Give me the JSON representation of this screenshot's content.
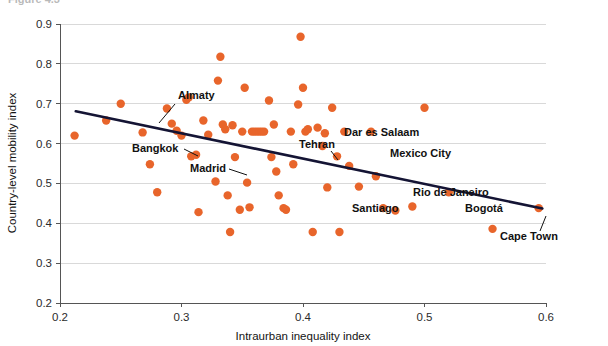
{
  "figure": {
    "title_sliver": "Figure 4.3",
    "background": "#ffffff"
  },
  "chart_data": {
    "type": "scatter",
    "title": "",
    "xlabel": "Intraurban inequality index",
    "ylabel": "Country-level mobility index",
    "xlim": [
      0.2,
      0.6
    ],
    "ylim": [
      0.2,
      0.9
    ],
    "xticks": [
      "0.2",
      "0.3",
      "0.4",
      "0.5",
      "0.6"
    ],
    "xtick_values": [
      0.2,
      0.3,
      0.4,
      0.5,
      0.6
    ],
    "yticks": [
      "0.2",
      "0.3",
      "0.4",
      "0.5",
      "0.6",
      "0.7",
      "0.8",
      "0.9"
    ],
    "ytick_values": [
      0.2,
      0.3,
      0.4,
      0.5,
      0.6,
      0.7,
      0.8,
      0.9
    ],
    "grid": "horizontal",
    "legend": "none",
    "point_color": "#E8652B",
    "point_radius": 4.2,
    "trendline": {
      "color": "#141434",
      "x": [
        0.213,
        0.597
      ],
      "y": [
        0.681,
        0.437
      ],
      "slope": -0.635,
      "intercept": 0.816
    },
    "points": [
      {
        "x": 0.212,
        "y": 0.62
      },
      {
        "x": 0.238,
        "y": 0.658
      },
      {
        "x": 0.25,
        "y": 0.7
      },
      {
        "x": 0.268,
        "y": 0.628
      },
      {
        "x": 0.274,
        "y": 0.548
      },
      {
        "x": 0.28,
        "y": 0.478
      },
      {
        "x": 0.288,
        "y": 0.688
      },
      {
        "x": 0.292,
        "y": 0.65
      },
      {
        "x": 0.296,
        "y": 0.632
      },
      {
        "x": 0.3,
        "y": 0.62
      },
      {
        "x": 0.304,
        "y": 0.71
      },
      {
        "x": 0.306,
        "y": 0.716
      },
      {
        "x": 0.308,
        "y": 0.568
      },
      {
        "x": 0.312,
        "y": 0.572
      },
      {
        "x": 0.314,
        "y": 0.428
      },
      {
        "x": 0.318,
        "y": 0.658
      },
      {
        "x": 0.322,
        "y": 0.622
      },
      {
        "x": 0.328,
        "y": 0.505
      },
      {
        "x": 0.33,
        "y": 0.758
      },
      {
        "x": 0.332,
        "y": 0.818
      },
      {
        "x": 0.334,
        "y": 0.648
      },
      {
        "x": 0.336,
        "y": 0.636
      },
      {
        "x": 0.338,
        "y": 0.47
      },
      {
        "x": 0.34,
        "y": 0.378
      },
      {
        "x": 0.342,
        "y": 0.646
      },
      {
        "x": 0.344,
        "y": 0.566
      },
      {
        "x": 0.348,
        "y": 0.434
      },
      {
        "x": 0.35,
        "y": 0.63
      },
      {
        "x": 0.352,
        "y": 0.74
      },
      {
        "x": 0.354,
        "y": 0.502
      },
      {
        "x": 0.356,
        "y": 0.44
      },
      {
        "x": 0.358,
        "y": 0.63
      },
      {
        "x": 0.36,
        "y": 0.63
      },
      {
        "x": 0.362,
        "y": 0.63
      },
      {
        "x": 0.364,
        "y": 0.63
      },
      {
        "x": 0.366,
        "y": 0.63
      },
      {
        "x": 0.368,
        "y": 0.63
      },
      {
        "x": 0.372,
        "y": 0.708
      },
      {
        "x": 0.374,
        "y": 0.566
      },
      {
        "x": 0.376,
        "y": 0.648
      },
      {
        "x": 0.378,
        "y": 0.53
      },
      {
        "x": 0.38,
        "y": 0.47
      },
      {
        "x": 0.384,
        "y": 0.438
      },
      {
        "x": 0.386,
        "y": 0.434
      },
      {
        "x": 0.39,
        "y": 0.63
      },
      {
        "x": 0.392,
        "y": 0.548
      },
      {
        "x": 0.396,
        "y": 0.698
      },
      {
        "x": 0.398,
        "y": 0.868
      },
      {
        "x": 0.4,
        "y": 0.74
      },
      {
        "x": 0.402,
        "y": 0.63
      },
      {
        "x": 0.404,
        "y": 0.636
      },
      {
        "x": 0.408,
        "y": 0.378
      },
      {
        "x": 0.412,
        "y": 0.64
      },
      {
        "x": 0.416,
        "y": 0.594
      },
      {
        "x": 0.418,
        "y": 0.626
      },
      {
        "x": 0.42,
        "y": 0.49
      },
      {
        "x": 0.424,
        "y": 0.69
      },
      {
        "x": 0.428,
        "y": 0.568
      },
      {
        "x": 0.43,
        "y": 0.378
      },
      {
        "x": 0.434,
        "y": 0.63
      },
      {
        "x": 0.438,
        "y": 0.544
      },
      {
        "x": 0.446,
        "y": 0.492
      },
      {
        "x": 0.456,
        "y": 0.63
      },
      {
        "x": 0.46,
        "y": 0.518
      },
      {
        "x": 0.466,
        "y": 0.438
      },
      {
        "x": 0.476,
        "y": 0.432
      },
      {
        "x": 0.49,
        "y": 0.442
      },
      {
        "x": 0.5,
        "y": 0.69
      },
      {
        "x": 0.52,
        "y": 0.478
      },
      {
        "x": 0.556,
        "y": 0.386
      },
      {
        "x": 0.594,
        "y": 0.438
      }
    ],
    "annotations": [
      {
        "label": "Almaty",
        "text_x": 178,
        "text_y": 99,
        "anchor": "start",
        "leader": [
          [
            175,
            104
          ],
          [
            159,
            123
          ]
        ]
      },
      {
        "label": "Bangkok",
        "text_x": 132,
        "text_y": 152,
        "anchor": "start",
        "leader": [
          [
            184,
            149
          ],
          [
            198,
            156
          ]
        ]
      },
      {
        "label": "Madrid",
        "text_x": 190,
        "text_y": 172,
        "anchor": "start",
        "leader": [
          [
            229,
            169
          ],
          [
            247,
            175
          ]
        ]
      },
      {
        "label": "Tehran",
        "text_x": 299,
        "text_y": 148,
        "anchor": "start",
        "leader": [
          [
            331,
            151
          ],
          [
            338,
            160
          ]
        ]
      },
      {
        "label": "Dar es Salaam",
        "text_x": 344,
        "text_y": 136,
        "anchor": "start",
        "leader": []
      },
      {
        "label": "Mexico City",
        "text_x": 390,
        "text_y": 157,
        "anchor": "start",
        "leader": []
      },
      {
        "label": "Rio de Janeiro",
        "text_x": 413,
        "text_y": 196,
        "anchor": "start",
        "leader": []
      },
      {
        "label": "Santiago",
        "text_x": 352,
        "text_y": 212,
        "anchor": "start",
        "leader": []
      },
      {
        "label": "Bogotá",
        "text_x": 465,
        "text_y": 212,
        "anchor": "start",
        "leader": []
      },
      {
        "label": "Cape Town",
        "text_x": 500,
        "text_y": 240,
        "anchor": "start",
        "leader": [
          [
            546,
            216
          ],
          [
            540,
            231
          ]
        ]
      }
    ]
  }
}
